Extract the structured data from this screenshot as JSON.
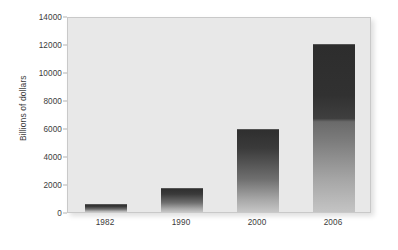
{
  "chart_data": {
    "type": "bar",
    "title": "",
    "subtitle": "",
    "xlabel": "",
    "ylabel": "Billions of dollars",
    "categories": [
      "1982",
      "1990",
      "2000",
      "2006"
    ],
    "values": [
      600,
      1750,
      5900,
      12000
    ],
    "series": [
      {
        "name": "",
        "values": [
          600,
          1750,
          5900,
          12000
        ]
      }
    ],
    "ylim": [
      0,
      14000
    ],
    "yticks": [
      0,
      2000,
      4000,
      6000,
      8000,
      10000,
      12000,
      14000
    ],
    "ytick_labels": [
      "0",
      "2000",
      "4000",
      "6000",
      "8000",
      "10000",
      "12000",
      "14000"
    ],
    "grid": false,
    "legend": null,
    "legend_position": "none",
    "annotations": [],
    "colors": {
      "bar_top": "#2f2f2f",
      "bar_bottom": "#c6c6c6",
      "plot_background": "#e8e8e8",
      "plot_border": "#c9c9c9",
      "text": "#3b3b3b",
      "page_background": "#ffffff"
    }
  }
}
